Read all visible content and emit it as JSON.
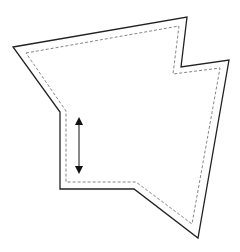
{
  "diagram": {
    "width": 240,
    "height": 252,
    "background": "#ffffff",
    "outer_outline": {
      "stroke": "#222222",
      "stroke_width": 1.3,
      "points": "13,47 187,17 181,67 229,60 198,238 134,189 60,189 60,112"
    },
    "inner_offset_outline": {
      "stroke": "#777777",
      "stroke_width": 0.9,
      "dash": "3,2",
      "points": "26,53 179,26 173,74 220,68 192,224 136,182 66,182 66,111"
    },
    "double_arrow": {
      "stroke": "#111111",
      "x": 79,
      "y1": 116,
      "y2": 175
    }
  }
}
